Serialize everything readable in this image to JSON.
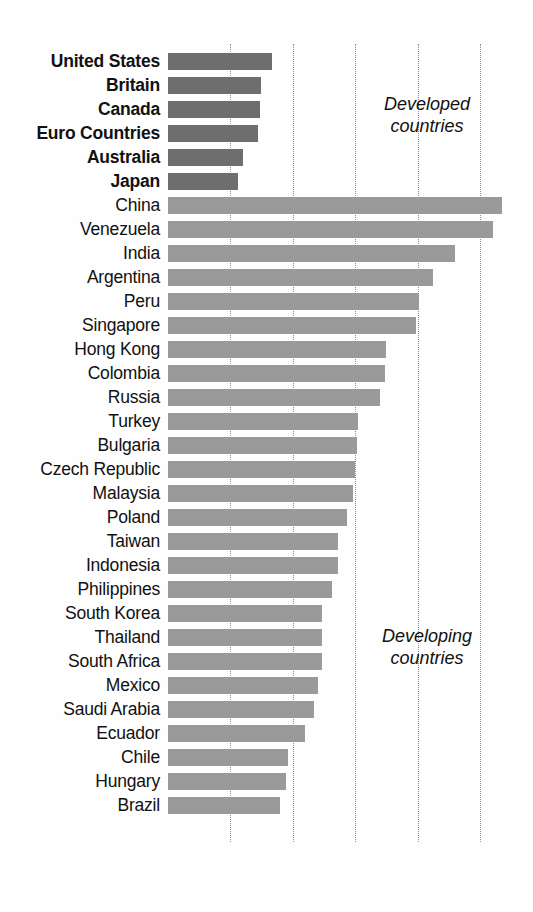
{
  "chart_data": {
    "type": "bar",
    "orientation": "horizontal",
    "title": "",
    "subtitle": "",
    "xlabel": "",
    "ylabel": "",
    "xlim": [
      0,
      11.2
    ],
    "xticks": [
      2,
      4,
      6,
      8,
      10
    ],
    "xtick_labels": [
      "2%",
      "4%",
      "6%",
      "8%",
      "10%"
    ],
    "grid": "vertical-dotted",
    "legend": "none",
    "value_unit": "%",
    "categories": [
      "United States",
      "Britain",
      "Canada",
      "Euro Countries",
      "Australia",
      "Japan",
      "China",
      "Venezuela",
      "India",
      "Argentina",
      "Peru",
      "Singapore",
      "Hong Kong",
      "Colombia",
      "Russia",
      "Turkey",
      "Bulgaria",
      "Czech Republic",
      "Malaysia",
      "Poland",
      "Taiwan",
      "Indonesia",
      "Philippines",
      "South Korea",
      "Thailand",
      "South Africa",
      "Mexico",
      "Saudi Arabia",
      "Ecuador",
      "Chile",
      "Hungary",
      "Brazil"
    ],
    "values": [
      3.35,
      3.0,
      2.95,
      2.9,
      2.4,
      2.25,
      10.7,
      10.4,
      9.2,
      8.5,
      8.05,
      7.95,
      7.0,
      6.95,
      6.8,
      6.1,
      6.05,
      6.0,
      5.95,
      5.75,
      5.45,
      5.45,
      5.25,
      4.95,
      4.95,
      4.95,
      4.8,
      4.7,
      4.4,
      3.85,
      3.8,
      3.6
    ],
    "groups": [
      {
        "name": "Developed countries",
        "annotation": "Developed\ncountries",
        "color": "#6e6e6e",
        "members": [
          "United States",
          "Britain",
          "Canada",
          "Euro Countries",
          "Australia",
          "Japan"
        ]
      },
      {
        "name": "Developing countries",
        "annotation": "Developing\ncountries",
        "color": "#9a9a9a",
        "members": [
          "China",
          "Venezuela",
          "India",
          "Argentina",
          "Peru",
          "Singapore",
          "Hong Kong",
          "Colombia",
          "Russia",
          "Turkey",
          "Bulgaria",
          "Czech Republic",
          "Malaysia",
          "Poland",
          "Taiwan",
          "Indonesia",
          "Philippines",
          "South Korea",
          "Thailand",
          "South Africa",
          "Mexico",
          "Saudi Arabia",
          "Ecuador",
          "Chile",
          "Hungary",
          "Brazil"
        ]
      }
    ],
    "rows": [
      {
        "label": "United States",
        "value": 3.35,
        "group": "developed"
      },
      {
        "label": "Britain",
        "value": 3.0,
        "group": "developed"
      },
      {
        "label": "Canada",
        "value": 2.95,
        "group": "developed"
      },
      {
        "label": "Euro Countries",
        "value": 2.9,
        "group": "developed"
      },
      {
        "label": "Australia",
        "value": 2.4,
        "group": "developed"
      },
      {
        "label": "Japan",
        "value": 2.25,
        "group": "developed"
      },
      {
        "label": "China",
        "value": 10.7,
        "group": "developing"
      },
      {
        "label": "Venezuela",
        "value": 10.4,
        "group": "developing"
      },
      {
        "label": "India",
        "value": 9.2,
        "group": "developing"
      },
      {
        "label": "Argentina",
        "value": 8.5,
        "group": "developing"
      },
      {
        "label": "Peru",
        "value": 8.05,
        "group": "developing"
      },
      {
        "label": "Singapore",
        "value": 7.95,
        "group": "developing"
      },
      {
        "label": "Hong Kong",
        "value": 7.0,
        "group": "developing"
      },
      {
        "label": "Colombia",
        "value": 6.95,
        "group": "developing"
      },
      {
        "label": "Russia",
        "value": 6.8,
        "group": "developing"
      },
      {
        "label": "Turkey",
        "value": 6.1,
        "group": "developing"
      },
      {
        "label": "Bulgaria",
        "value": 6.05,
        "group": "developing"
      },
      {
        "label": "Czech Republic",
        "value": 6.0,
        "group": "developing"
      },
      {
        "label": "Malaysia",
        "value": 5.95,
        "group": "developing"
      },
      {
        "label": "Poland",
        "value": 5.75,
        "group": "developing"
      },
      {
        "label": "Taiwan",
        "value": 5.45,
        "group": "developing"
      },
      {
        "label": "Indonesia",
        "value": 5.45,
        "group": "developing"
      },
      {
        "label": "Philippines",
        "value": 5.25,
        "group": "developing"
      },
      {
        "label": "South Korea",
        "value": 4.95,
        "group": "developing"
      },
      {
        "label": "Thailand",
        "value": 4.95,
        "group": "developing"
      },
      {
        "label": "South Africa",
        "value": 4.95,
        "group": "developing"
      },
      {
        "label": "Mexico",
        "value": 4.8,
        "group": "developing"
      },
      {
        "label": "Saudi Arabia",
        "value": 4.7,
        "group": "developing"
      },
      {
        "label": "Ecuador",
        "value": 4.4,
        "group": "developing"
      },
      {
        "label": "Chile",
        "value": 3.85,
        "group": "developing"
      },
      {
        "label": "Hungary",
        "value": 3.8,
        "group": "developing"
      },
      {
        "label": "Brazil",
        "value": 3.6,
        "group": "developing"
      }
    ]
  },
  "colors": {
    "developed_bar": "#6e6e6e",
    "developing_bar": "#9a9a9a",
    "gridline": "#8e8e8e",
    "text": "#111111",
    "background": "#fefefe"
  },
  "annotations": {
    "developed": "Developed\ncountries",
    "developing": "Developing\ncountries"
  },
  "axis": {
    "tick_labels": [
      "2%",
      "4%",
      "6%",
      "8%",
      "10%"
    ]
  },
  "geometry": {
    "origin_x": 167.5,
    "px_per_percent": 31.25,
    "first_row_top": 50,
    "row_height": 24,
    "bar_height": 17
  }
}
